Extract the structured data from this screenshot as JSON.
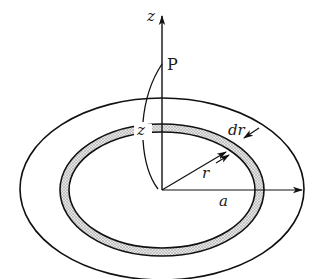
{
  "diagram": {
    "labels": {
      "z_axis": "z",
      "point": "P",
      "height": "z",
      "ring_width": "dr",
      "ring_radius": "r",
      "disk_radius": "a"
    },
    "colors": {
      "stroke": "#111111",
      "ring_fill": "#c8c8c8",
      "background": "#ffffff"
    }
  }
}
